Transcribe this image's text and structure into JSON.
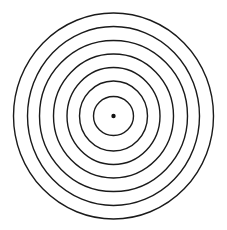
{
  "diagram": {
    "type": "concentric-circles",
    "background": "#ffffff",
    "stroke_color": "#1a1a1a",
    "stroke_width": 1.4,
    "center": {
      "x": 113.5,
      "y": 116
    },
    "ring_count": 7,
    "rings": [
      {
        "rx": 100,
        "ry": 103
      },
      {
        "rx": 86,
        "ry": 89.5
      },
      {
        "rx": 74,
        "ry": 75.5
      },
      {
        "rx": 60,
        "ry": 62
      },
      {
        "rx": 46.5,
        "ry": 48.5
      },
      {
        "rx": 34,
        "ry": 35
      },
      {
        "rx": 20,
        "ry": 19.5
      }
    ],
    "center_dot": {
      "r": 2.2,
      "color": "#111111"
    }
  }
}
